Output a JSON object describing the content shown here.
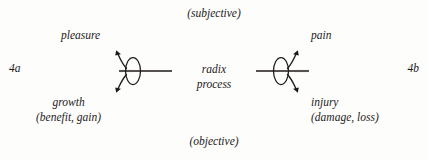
{
  "figure": {
    "axis": {
      "top_label": "(subjective)",
      "bottom_label": "(objective)"
    },
    "index_marks": {
      "left": "4a",
      "right": "4b"
    },
    "center": {
      "line1": "radix",
      "line2": "process"
    },
    "left_side": {
      "upper_label": "pleasure",
      "lower_label": "growth",
      "lower_parenthetical": "(benefit, gain)"
    },
    "right_side": {
      "upper_label": "pain",
      "lower_label": "injury",
      "lower_parenthetical": "(damage, loss)"
    },
    "glyphs": {
      "left_name": "converging-radix-node",
      "right_name": "diverging-radix-node"
    },
    "colors": {
      "ink": "#1d1b1a",
      "stem": "#55524f",
      "background": "#fdfdfc"
    }
  }
}
